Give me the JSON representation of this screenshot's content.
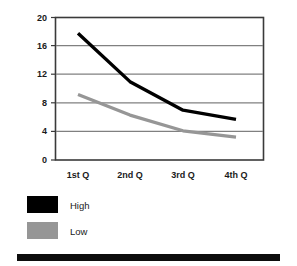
{
  "chart_data": {
    "type": "line",
    "title": "",
    "subtitle": "",
    "xlabel": "",
    "ylabel": "",
    "categories": [
      "1st Q",
      "2nd Q",
      "3rd Q",
      "4th Q"
    ],
    "series": [
      {
        "name": "High",
        "color": "#000000",
        "values": [
          17.8,
          11.0,
          7.0,
          5.7
        ]
      },
      {
        "name": "Low",
        "color": "#969696",
        "values": [
          9.2,
          6.3,
          4.1,
          3.2
        ]
      }
    ],
    "ylim": [
      0,
      20
    ],
    "yticks": [
      0,
      4,
      8,
      12,
      16,
      20
    ],
    "ytick_labels": [
      "0",
      "4",
      "8",
      "12",
      "16",
      "20"
    ],
    "grid": true,
    "grid_axis": "y",
    "legend_position": "bottom-left",
    "legend": [
      {
        "label": "High",
        "color": "#000000"
      },
      {
        "label": "Low",
        "color": "#969696"
      }
    ],
    "frame_color": "#3a3a3a",
    "gridline_color": "#808080",
    "footer_bar_color": "#0d0d0d"
  }
}
